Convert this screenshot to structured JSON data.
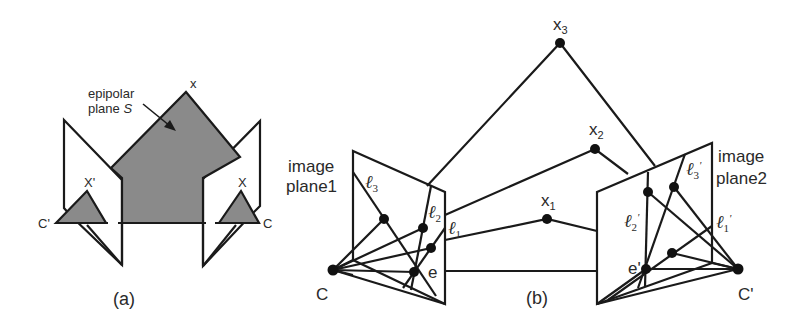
{
  "figure_a": {
    "caption": "(a)",
    "epipolar_label_line1": "epipolar",
    "epipolar_label_line2": "plane ",
    "epipolar_symbol": "S",
    "point_x": "x",
    "point_x_left": "X'",
    "point_x_right": "X",
    "camera_left": "C'",
    "camera_right": "C"
  },
  "figure_b": {
    "caption": "(b)",
    "image_plane1_line1": "image",
    "image_plane1_line2": "plane1",
    "image_plane2_line1": "image",
    "image_plane2_line2": "plane2",
    "camera_left": "C",
    "camera_right": "C'",
    "epipole_left": "e",
    "epipole_right": "e'",
    "points": [
      {
        "name": "x",
        "sub": "1"
      },
      {
        "name": "x",
        "sub": "2"
      },
      {
        "name": "x",
        "sub": "3"
      }
    ],
    "lines_left": [
      {
        "name": "ℓ",
        "sub": "1"
      },
      {
        "name": "ℓ",
        "sub": "2"
      },
      {
        "name": "ℓ",
        "sub": "3"
      }
    ],
    "lines_right": [
      {
        "name": "ℓ",
        "sub": "1",
        "prime": "'"
      },
      {
        "name": "ℓ",
        "sub": "2",
        "prime": "'"
      },
      {
        "name": "ℓ",
        "sub": "3",
        "prime": "'"
      }
    ]
  },
  "colors": {
    "stroke": "#1a1a1a",
    "fill_gray": "#8a8a8a",
    "background": "#ffffff"
  }
}
